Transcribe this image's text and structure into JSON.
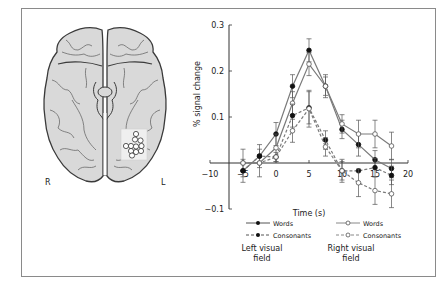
{
  "figure": {
    "brain": {
      "hemisphere_labels": {
        "right": "R",
        "left": "L"
      },
      "roi_highlight": "white circles in left occipito-temporal region"
    },
    "legend": {
      "left_group_label_line1": "Left visual",
      "left_group_label_line2": "field",
      "right_group_label_line1": "Right visual",
      "right_group_label_line2": "field",
      "items": [
        {
          "label": "Words",
          "group": "left",
          "marker": "filled",
          "line": "solid"
        },
        {
          "label": "Consonants",
          "group": "left",
          "marker": "filled",
          "line": "dashed"
        },
        {
          "label": "Words",
          "group": "right",
          "marker": "open",
          "line": "solid"
        },
        {
          "label": "Consonants",
          "group": "right",
          "marker": "open",
          "line": "dashed"
        }
      ]
    },
    "colors": {
      "line": "#7a7a7a",
      "axis": "#333333",
      "brain_fill": "#d9d9d9",
      "brain_stroke": "#3a3a3a",
      "frame": "#8a8a8a"
    }
  },
  "chart_data": {
    "type": "line",
    "title": "",
    "xlabel": "Time (s)",
    "ylabel": "% signal change",
    "xlim": [
      -10,
      20
    ],
    "ylim": [
      -0.1,
      0.3
    ],
    "x_ticks": [
      -10,
      -5,
      0,
      5,
      10,
      15,
      20
    ],
    "x_tick_labels": [
      "−10",
      "−5",
      "0",
      "5",
      "10",
      "15",
      "20"
    ],
    "y_ticks": [
      -0.1,
      0.1,
      0.2,
      0.3
    ],
    "y_tick_labels": [
      "−0.1",
      "0.1",
      "0.2",
      "0.3"
    ],
    "grid": false,
    "legend_position": "bottom",
    "x": [
      -5,
      -2.5,
      0,
      2.5,
      5,
      7.5,
      10,
      12.5,
      15,
      17.5
    ],
    "series": [
      {
        "name": "Words (Left visual field)",
        "marker": "filled",
        "dash": false,
        "values": [
          -0.017,
          0.015,
          0.063,
          0.167,
          0.245,
          0.167,
          0.073,
          0.04,
          0.007,
          -0.012
        ],
        "err": [
          0.025,
          0.025,
          0.025,
          0.025,
          0.025,
          0.02,
          0.02,
          0.025,
          0.02,
          0.02
        ]
      },
      {
        "name": "Words (Right visual field)",
        "marker": "open",
        "dash": false,
        "values": [
          0.0,
          0.0,
          0.033,
          0.13,
          0.215,
          0.167,
          0.085,
          0.063,
          0.063,
          0.037
        ],
        "err": [
          0.03,
          0.03,
          0.03,
          0.025,
          0.025,
          0.025,
          0.02,
          0.03,
          0.03,
          0.03
        ]
      },
      {
        "name": "Consonants (Left visual field)",
        "marker": "filled",
        "dash": true,
        "values": [
          -0.017,
          0.015,
          0.013,
          0.103,
          0.12,
          0.05,
          -0.017,
          -0.017,
          -0.01,
          -0.027
        ],
        "err": [
          0.0,
          0.0,
          0.0,
          0.025,
          0.035,
          0.02,
          0.02,
          0.0,
          0.02,
          0.02
        ]
      },
      {
        "name": "Consonants (Right visual field)",
        "marker": "open",
        "dash": true,
        "values": [
          0.0,
          0.0,
          0.013,
          0.07,
          0.118,
          0.035,
          -0.017,
          -0.043,
          -0.06,
          -0.067
        ],
        "err": [
          0.0,
          0.0,
          0.01,
          0.025,
          0.04,
          0.02,
          0.025,
          0.03,
          0.03,
          0.03
        ]
      }
    ]
  }
}
